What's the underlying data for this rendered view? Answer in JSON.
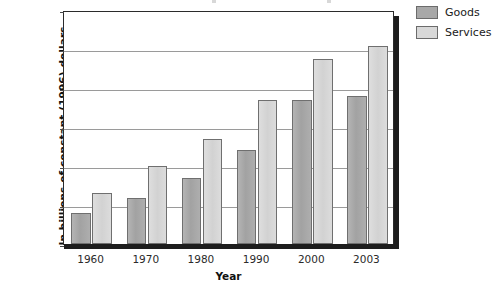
{
  "chart_data": {
    "type": "bar",
    "title": "",
    "xlabel": "Year",
    "ylabel": "In billions of constant (1996) dollars",
    "categories": [
      "1960",
      "1970",
      "1980",
      "1990",
      "2000",
      "2003"
    ],
    "series": [
      {
        "name": "Goods",
        "values": [
          800,
          1170,
          1680,
          2420,
          3680,
          3800
        ],
        "color": "#a8a8a8"
      },
      {
        "name": "Services",
        "values": [
          1300,
          2000,
          2700,
          3700,
          4750,
          5080
        ],
        "color": "#d8d8d8"
      }
    ],
    "ylim": [
      0,
      6000
    ],
    "yticks": [
      0,
      1000,
      2000,
      3000,
      4000,
      5000,
      6000
    ],
    "ytick_labels": [
      "0",
      "1,000",
      "2,000",
      "3,000",
      "4,000",
      "5,000",
      "6,000"
    ],
    "grid": true,
    "legend_position": "top-right"
  },
  "legend": {
    "items": [
      {
        "label": "Goods"
      },
      {
        "label": "Services"
      }
    ]
  }
}
